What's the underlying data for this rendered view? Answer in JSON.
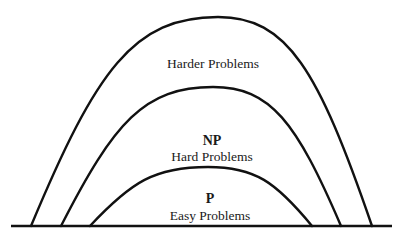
{
  "diagram": {
    "type": "nested-complexity-hills",
    "baseline": {
      "x1": 11,
      "x2": 392,
      "y": 226
    },
    "regions": [
      {
        "id": "harder",
        "title": "",
        "label": "Harder Problems",
        "curve": {
          "left_foot": 31,
          "right_foot": 372,
          "peak_x": 218,
          "peak_y": 17
        },
        "label_pos": {
          "x": 213,
          "y": 68
        }
      },
      {
        "id": "np",
        "title": "NP",
        "label": "Hard Problems",
        "curve": {
          "left_foot": 61,
          "right_foot": 341,
          "peak_x": 213,
          "peak_y": 87
        },
        "title_pos": {
          "x": 212,
          "y": 145
        },
        "label_pos": {
          "x": 212,
          "y": 161
        }
      },
      {
        "id": "p",
        "title": "P",
        "label": "Easy Problems",
        "curve": {
          "left_foot": 90,
          "right_foot": 312,
          "peak_x": 208,
          "peak_y": 167
        },
        "title_pos": {
          "x": 210,
          "y": 203
        },
        "label_pos": {
          "x": 210,
          "y": 220
        }
      }
    ],
    "stroke_color": "#111111",
    "stroke_width": 2.4
  }
}
